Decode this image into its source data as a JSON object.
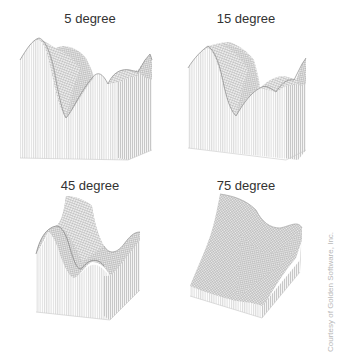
{
  "figure": {
    "panels": [
      {
        "title": "5 degree",
        "tilt_degrees": 5
      },
      {
        "title": "15 degree",
        "tilt_degrees": 15
      },
      {
        "title": "45 degree",
        "tilt_degrees": 45
      },
      {
        "title": "75 degree",
        "tilt_degrees": 75
      }
    ],
    "credit": "Courtesy of Golden Software, Inc.",
    "colors": {
      "background": "#ffffff",
      "mesh_line": "#9a9a9a",
      "skirt_line": "#b5b5b5",
      "title_text": "#333333",
      "credit_text": "#b8b8b8"
    }
  }
}
